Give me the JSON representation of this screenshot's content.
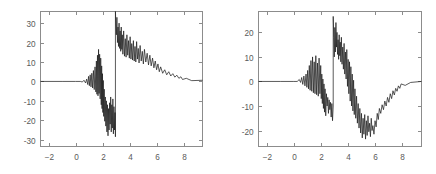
{
  "figure": {
    "background_color": "#ffffff",
    "line_color": "#1a1a1a",
    "axis_color": "#8c8c8c",
    "panel_count": 2
  },
  "chart_data": [
    {
      "type": "line",
      "name": "left-signal-plot",
      "title": "",
      "subtitle": "",
      "xlabel": "",
      "ylabel": "",
      "xlim": [
        -2.6,
        9.4
      ],
      "ylim": [
        -33.5,
        36.0
      ],
      "grid": false,
      "legend": null,
      "annotations": [],
      "xticks": [
        -2,
        0,
        2,
        4,
        6,
        8
      ],
      "xticklabels": [
        "-2",
        "0",
        "2",
        "4",
        "6",
        "8"
      ],
      "yticks": [
        -30,
        -20,
        -10,
        0,
        10,
        20,
        30
      ],
      "yticklabels": [
        "-30",
        "-20",
        "-10",
        "0",
        "10",
        "20",
        "30"
      ],
      "description": "Noisy oscillatory transient: flat zero baseline, positive noise burst near x=1.8, deep negative excursion from x=2 to x=3, abrupt vertical discontinuity at x=2.95, large positive lobe decaying to zero by x=7.9",
      "x": [
        -2.6,
        -1.0,
        0.0,
        0.35,
        0.5,
        0.62,
        0.74,
        0.82,
        0.9,
        0.96,
        1.02,
        1.08,
        1.14,
        1.2,
        1.26,
        1.32,
        1.38,
        1.44,
        1.5,
        1.54,
        1.58,
        1.62,
        1.66,
        1.7,
        1.74,
        1.78,
        1.82,
        1.86,
        1.9,
        1.93,
        1.96,
        1.99,
        2.02,
        2.05,
        2.08,
        2.12,
        2.16,
        2.2,
        2.24,
        2.28,
        2.32,
        2.36,
        2.4,
        2.44,
        2.48,
        2.52,
        2.56,
        2.6,
        2.64,
        2.68,
        2.72,
        2.76,
        2.8,
        2.84,
        2.88,
        2.92,
        2.95,
        2.95,
        2.98,
        3.02,
        3.06,
        3.1,
        3.14,
        3.18,
        3.22,
        3.26,
        3.3,
        3.34,
        3.38,
        3.42,
        3.46,
        3.5,
        3.56,
        3.62,
        3.68,
        3.74,
        3.8,
        3.86,
        3.92,
        3.98,
        4.04,
        4.1,
        4.16,
        4.22,
        4.28,
        4.34,
        4.4,
        4.46,
        4.52,
        4.58,
        4.64,
        4.7,
        4.78,
        4.86,
        4.94,
        5.02,
        5.1,
        5.2,
        5.3,
        5.4,
        5.5,
        5.6,
        5.7,
        5.8,
        5.9,
        6.0,
        6.1,
        6.2,
        6.3,
        6.45,
        6.6,
        6.75,
        6.9,
        7.05,
        7.2,
        7.35,
        7.5,
        7.65,
        7.8,
        7.92,
        8.2,
        8.6,
        9.4
      ],
      "y": [
        0,
        0,
        0,
        0,
        -0.3,
        0.6,
        -0.8,
        1.2,
        -1.6,
        2.6,
        -2.2,
        3.4,
        -2.8,
        4.2,
        -3.4,
        5.6,
        -4.2,
        7.5,
        -5.4,
        10.5,
        -6.6,
        13.5,
        -7.4,
        16.5,
        -6.2,
        14.0,
        -9.0,
        12.0,
        -12.0,
        8.0,
        -14.0,
        4.0,
        -16.0,
        0.5,
        -18.0,
        -4.0,
        -20.5,
        -8.0,
        -23.0,
        -10.0,
        -26.0,
        -12.0,
        -28.0,
        -14.0,
        -25.0,
        -11.0,
        -22.0,
        -8.0,
        -26.0,
        -12.0,
        -24.0,
        -9.0,
        -27.0,
        -13.0,
        -25.0,
        -16.0,
        -28.5,
        36.0,
        30.0,
        24.0,
        33.0,
        20.0,
        28.0,
        18.0,
        30.0,
        17.0,
        26.0,
        15.5,
        28.0,
        16.5,
        24.0,
        14.0,
        26.0,
        13.0,
        22.0,
        12.5,
        24.0,
        13.5,
        21.0,
        12.0,
        23.0,
        11.5,
        19.5,
        11.0,
        21.0,
        10.5,
        18.0,
        10.0,
        20.5,
        11.5,
        17.0,
        9.5,
        18.5,
        10.5,
        15.5,
        9.0,
        16.5,
        10.0,
        14.5,
        8.5,
        13.5,
        8.0,
        12.0,
        7.0,
        10.5,
        6.0,
        9.0,
        5.0,
        7.5,
        4.2,
        6.0,
        3.4,
        5.0,
        2.8,
        4.0,
        2.2,
        3.2,
        1.6,
        2.4,
        1.0,
        1.6,
        0.4,
        0.6,
        0,
        0,
        0
      ]
    },
    {
      "type": "line",
      "name": "right-signal-plot",
      "title": "",
      "subtitle": "",
      "xlabel": "",
      "ylabel": "",
      "xlim": [
        -2.6,
        9.4
      ],
      "ylim": [
        -26.5,
        28.5
      ],
      "grid": false,
      "legend": null,
      "annotations": [],
      "xticks": [
        -2,
        0,
        2,
        4,
        6,
        8
      ],
      "xticklabels": [
        "-2",
        "0",
        "2",
        "4",
        "6",
        "8"
      ],
      "yticks": [
        -20,
        -10,
        0,
        10,
        20
      ],
      "yticklabels": [
        "-20",
        "-10",
        "0",
        "10",
        "20"
      ],
      "description": "Noisy oscillatory transient: flat zero baseline, moderate positive noise near x=1.5, negative dip x=2 to x=2.8, vertical discontinuity at x=2.9 reaching +26, positive lobe near x=3.3, long negative trough around x=4.5 to x=6, smooth recovery to zero by x=7.9",
      "x": [
        -2.6,
        -1.0,
        0.0,
        0.25,
        0.4,
        0.5,
        0.58,
        0.66,
        0.74,
        0.82,
        0.9,
        0.96,
        1.02,
        1.08,
        1.14,
        1.2,
        1.26,
        1.32,
        1.38,
        1.44,
        1.5,
        1.56,
        1.62,
        1.68,
        1.74,
        1.8,
        1.86,
        1.92,
        1.98,
        2.02,
        2.06,
        2.1,
        2.14,
        2.18,
        2.22,
        2.26,
        2.3,
        2.35,
        2.4,
        2.45,
        2.5,
        2.55,
        2.6,
        2.65,
        2.7,
        2.75,
        2.8,
        2.85,
        2.9,
        2.9,
        2.94,
        2.98,
        3.02,
        3.06,
        3.1,
        3.14,
        3.18,
        3.22,
        3.26,
        3.3,
        3.34,
        3.38,
        3.42,
        3.46,
        3.5,
        3.55,
        3.6,
        3.65,
        3.7,
        3.75,
        3.8,
        3.85,
        3.9,
        3.95,
        4.0,
        4.05,
        4.1,
        4.15,
        4.2,
        4.25,
        4.3,
        4.35,
        4.4,
        4.45,
        4.5,
        4.56,
        4.62,
        4.68,
        4.74,
        4.8,
        4.86,
        4.92,
        4.98,
        5.04,
        5.1,
        5.16,
        5.22,
        5.28,
        5.34,
        5.4,
        5.46,
        5.52,
        5.58,
        5.64,
        5.7,
        5.76,
        5.82,
        5.9,
        5.98,
        6.06,
        6.14,
        6.22,
        6.3,
        6.4,
        6.5,
        6.6,
        6.7,
        6.8,
        6.9,
        7.0,
        7.1,
        7.2,
        7.3,
        7.4,
        7.5,
        7.6,
        7.7,
        7.8,
        7.9,
        8.2,
        8.6,
        9.4
      ],
      "y": [
        0,
        0,
        0,
        0,
        0.8,
        -0.4,
        1.6,
        -1.2,
        2.2,
        -1.8,
        3.0,
        -2.4,
        4.5,
        -3.0,
        6.5,
        -3.6,
        8.5,
        -4.0,
        10.0,
        -4.6,
        8.0,
        -5.0,
        10.5,
        -5.4,
        7.5,
        -6.0,
        9.5,
        -5.0,
        6.5,
        -7.0,
        3.0,
        -9.0,
        1.0,
        -11.0,
        -1.0,
        -12.5,
        -3.0,
        -14.0,
        -5.0,
        -10.0,
        -6.5,
        -13.0,
        -7.5,
        -11.5,
        -8.5,
        -14.5,
        -9.0,
        -16.0,
        -10.0,
        26.5,
        18.0,
        10.0,
        22.0,
        12.0,
        24.0,
        14.0,
        20.0,
        11.0,
        17.0,
        9.0,
        19.0,
        10.5,
        16.0,
        8.0,
        18.0,
        7.0,
        14.0,
        5.0,
        15.5,
        3.0,
        12.0,
        1.0,
        13.0,
        -2.0,
        9.0,
        -5.0,
        8.0,
        -8.0,
        6.0,
        -10.0,
        3.0,
        -12.0,
        0.5,
        -13.5,
        -3.0,
        -15.0,
        -6.0,
        -17.0,
        -9.0,
        -19.0,
        -11.0,
        -21.0,
        -13.0,
        -23.0,
        -15.0,
        -21.5,
        -13.5,
        -23.5,
        -16.0,
        -22.0,
        -14.0,
        -20.5,
        -17.0,
        -22.5,
        -15.0,
        -20.0,
        -18.0,
        -21.5,
        -16.0,
        -18.5,
        -13.0,
        -15.5,
        -11.0,
        -13.0,
        -9.5,
        -11.5,
        -8.0,
        -10.0,
        -6.5,
        -8.5,
        -5.0,
        -7.0,
        -3.8,
        -5.5,
        -2.8,
        -4.0,
        -1.8,
        -2.8,
        -1.0,
        -1.6,
        -0.4,
        0,
        0,
        0,
        0
      ]
    }
  ]
}
